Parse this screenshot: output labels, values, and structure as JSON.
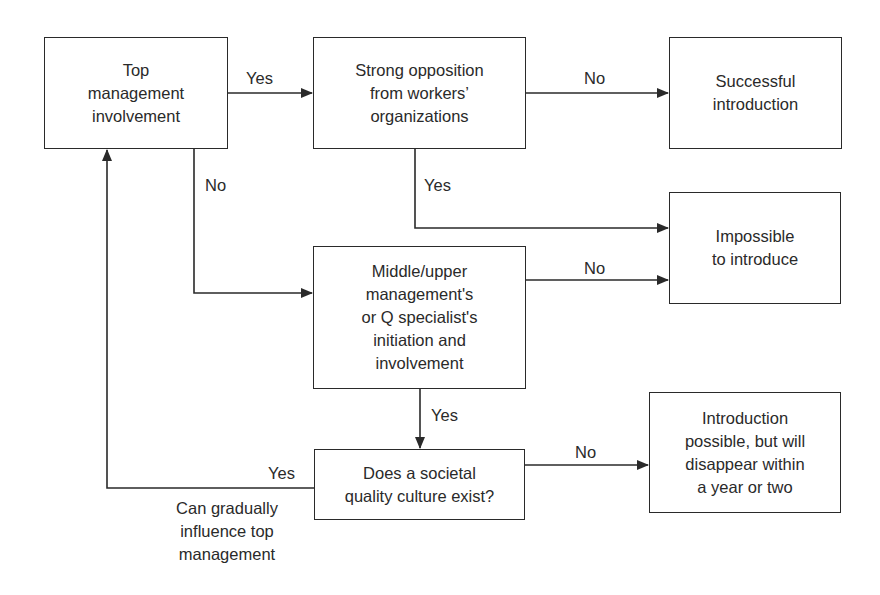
{
  "diagram": {
    "type": "flowchart",
    "nodes": {
      "top_mgmt": "Top\nmanagement\ninvolvement",
      "strong_opposition": "Strong opposition\nfrom workers’\norganizations",
      "successful": "Successful\nintroduction",
      "impossible": "Impossible\nto introduce",
      "middle_mgmt": "Middle/upper\nmanagement's\nor Q specialist's\ninitiation and\ninvolvement",
      "societal_culture": "Does a societal\nquality culture exist?",
      "disappear": "Introduction\npossible, but will\ndisappear within\na year or two"
    },
    "edges": {
      "top_to_opposition": "Yes",
      "top_to_middle": "No",
      "opposition_to_successful": "No",
      "opposition_to_impossible": "Yes",
      "middle_to_impossible": "No",
      "middle_to_societal": "Yes",
      "societal_to_disappear": "No",
      "societal_to_top": "Yes",
      "societal_to_top_note": "Can gradually\ninfluence top\nmanagement"
    },
    "colors": {
      "stroke": "#2a2a2a",
      "background": "#ffffff"
    }
  }
}
